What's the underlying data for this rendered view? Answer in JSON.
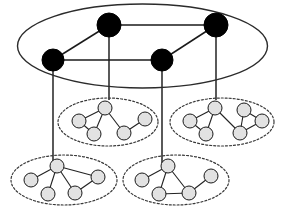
{
  "figure": {
    "type": "node-link-diagram",
    "width": 285,
    "height": 211,
    "background_color": "#ffffff"
  },
  "colors": {
    "supernode_fill": "#000000",
    "supernode_stroke": "#000000",
    "superedge_stroke": "#1a1a1a",
    "top_boundary_stroke": "#2b2b2b",
    "cluster_boundary_stroke": "#3a3a3a",
    "connector_stroke": "#3d3d3d",
    "leafnode_fill": "#e2e2e2",
    "leafnode_stroke": "#1a1a1a",
    "leafedge_stroke": "#222222"
  },
  "top_level": {
    "boundary": {
      "cx": 142.5,
      "cy": 46,
      "rx": 125,
      "ry": 42
    },
    "nodes": [
      {
        "id": "A",
        "label": "",
        "cx": 53,
        "cy": 60,
        "r": 11
      },
      {
        "id": "B",
        "label": "",
        "cx": 109,
        "cy": 25,
        "r": 12
      },
      {
        "id": "C",
        "label": "",
        "cx": 162,
        "cy": 60,
        "r": 11
      },
      {
        "id": "D",
        "label": "",
        "cx": 216,
        "cy": 25,
        "r": 12
      }
    ],
    "edges": [
      {
        "from": "A",
        "to": "B"
      },
      {
        "from": "B",
        "to": "D"
      },
      {
        "from": "A",
        "to": "C"
      },
      {
        "from": "C",
        "to": "D"
      }
    ]
  },
  "connectors": [
    {
      "from": "A",
      "to": "cluster3",
      "x1": 53,
      "y1": 60,
      "x2": 53,
      "y2": 163
    },
    {
      "from": "B",
      "to": "cluster1",
      "x1": 109,
      "y1": 25,
      "x2": 109,
      "y2": 100
    },
    {
      "from": "C",
      "to": "cluster4",
      "x1": 162,
      "y1": 60,
      "x2": 162,
      "y2": 163
    },
    {
      "from": "D",
      "to": "cluster2",
      "x1": 216,
      "y1": 25,
      "x2": 216,
      "y2": 100
    }
  ],
  "clusters": [
    {
      "id": "cluster1",
      "name": "top-left-cluster",
      "boundary": {
        "cx": 108,
        "cy": 122,
        "rx": 50,
        "ry": 24
      },
      "nodes": [
        {
          "id": "c1n1",
          "cx": 105,
          "cy": 108,
          "r": 7
        },
        {
          "id": "c1n2",
          "cx": 79,
          "cy": 121,
          "r": 7
        },
        {
          "id": "c1n3",
          "cx": 94,
          "cy": 134,
          "r": 7
        },
        {
          "id": "c1n4",
          "cx": 124,
          "cy": 133,
          "r": 7
        },
        {
          "id": "c1n5",
          "cx": 145,
          "cy": 119,
          "r": 7
        }
      ],
      "edges": [
        {
          "from": "c1n1",
          "to": "c1n2"
        },
        {
          "from": "c1n1",
          "to": "c1n3"
        },
        {
          "from": "c1n1",
          "to": "c1n4"
        },
        {
          "from": "c1n2",
          "to": "c1n3"
        },
        {
          "from": "c1n4",
          "to": "c1n5"
        }
      ]
    },
    {
      "id": "cluster2",
      "name": "top-right-cluster",
      "boundary": {
        "cx": 222,
        "cy": 122,
        "rx": 52,
        "ry": 24
      },
      "nodes": [
        {
          "id": "c2n1",
          "cx": 215,
          "cy": 108,
          "r": 7
        },
        {
          "id": "c2n2",
          "cx": 190,
          "cy": 121,
          "r": 7
        },
        {
          "id": "c2n3",
          "cx": 206,
          "cy": 134,
          "r": 7
        },
        {
          "id": "c2n4",
          "cx": 240,
          "cy": 133,
          "r": 7
        },
        {
          "id": "c2n5",
          "cx": 244,
          "cy": 110,
          "r": 7
        },
        {
          "id": "c2n6",
          "cx": 262,
          "cy": 121,
          "r": 7
        }
      ],
      "edges": [
        {
          "from": "c2n1",
          "to": "c2n2"
        },
        {
          "from": "c2n1",
          "to": "c2n3"
        },
        {
          "from": "c2n1",
          "to": "c2n4"
        },
        {
          "from": "c2n2",
          "to": "c2n3"
        },
        {
          "from": "c2n4",
          "to": "c2n5"
        },
        {
          "from": "c2n4",
          "to": "c2n6"
        },
        {
          "from": "c2n5",
          "to": "c2n6"
        }
      ]
    },
    {
      "id": "cluster3",
      "name": "bottom-left-cluster",
      "boundary": {
        "cx": 64,
        "cy": 180,
        "rx": 53,
        "ry": 25
      },
      "nodes": [
        {
          "id": "c3n1",
          "cx": 57,
          "cy": 166,
          "r": 7
        },
        {
          "id": "c3n2",
          "cx": 31,
          "cy": 180,
          "r": 7
        },
        {
          "id": "c3n3",
          "cx": 48,
          "cy": 194,
          "r": 7
        },
        {
          "id": "c3n4",
          "cx": 75,
          "cy": 193,
          "r": 7
        },
        {
          "id": "c3n5",
          "cx": 98,
          "cy": 177,
          "r": 7
        }
      ],
      "edges": [
        {
          "from": "c3n1",
          "to": "c3n2"
        },
        {
          "from": "c3n1",
          "to": "c3n3"
        },
        {
          "from": "c3n1",
          "to": "c3n4"
        },
        {
          "from": "c3n1",
          "to": "c3n5"
        },
        {
          "from": "c3n4",
          "to": "c3n5"
        }
      ]
    },
    {
      "id": "cluster4",
      "name": "bottom-right-cluster",
      "boundary": {
        "cx": 176,
        "cy": 180,
        "rx": 53,
        "ry": 25
      },
      "nodes": [
        {
          "id": "c4n1",
          "cx": 168,
          "cy": 166,
          "r": 7
        },
        {
          "id": "c4n2",
          "cx": 142,
          "cy": 180,
          "r": 7
        },
        {
          "id": "c4n3",
          "cx": 159,
          "cy": 194,
          "r": 7
        },
        {
          "id": "c4n4",
          "cx": 189,
          "cy": 193,
          "r": 7
        },
        {
          "id": "c4n5",
          "cx": 211,
          "cy": 176,
          "r": 7
        }
      ],
      "edges": [
        {
          "from": "c4n1",
          "to": "c4n2"
        },
        {
          "from": "c4n1",
          "to": "c4n3"
        },
        {
          "from": "c4n1",
          "to": "c4n4"
        },
        {
          "from": "c4n3",
          "to": "c4n4"
        },
        {
          "from": "c4n4",
          "to": "c4n5"
        }
      ]
    }
  ]
}
